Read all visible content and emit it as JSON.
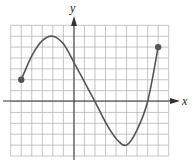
{
  "figure": {
    "title": "",
    "x_axis_label": "x",
    "y_axis_label": "y",
    "grid": {
      "cols": 15,
      "rows": 12,
      "x_min": -6,
      "x_max": 9,
      "y_min": -5,
      "y_max": 7
    },
    "colors": {
      "grid": "#b5b5b5",
      "axis": "#333333",
      "curve": "#555555",
      "endpoint": "#555555"
    }
  },
  "chart_data": {
    "type": "line",
    "title": "",
    "xlabel": "x",
    "ylabel": "y",
    "xlim": [
      -6,
      9
    ],
    "ylim": [
      -5,
      7
    ],
    "grid": true,
    "tick_labels": false,
    "series": [
      {
        "name": "f(x)",
        "x": [
          -5,
          -4,
          -3,
          -2,
          -1,
          0,
          1,
          2,
          3,
          4,
          5,
          6,
          7,
          8
        ],
        "y": [
          2,
          4.2,
          5.6,
          6,
          5.3,
          3.6,
          1.8,
          0,
          -1.9,
          -3.4,
          -4,
          -2.6,
          0,
          5
        ]
      }
    ],
    "endpoints": [
      {
        "x": -5,
        "y": 2,
        "filled": true
      },
      {
        "x": 8,
        "y": 5,
        "filled": true
      }
    ],
    "annotations": [
      {
        "label": "local max",
        "x": -2,
        "y": 6
      },
      {
        "label": "local min",
        "x": 5,
        "y": -4
      }
    ]
  }
}
